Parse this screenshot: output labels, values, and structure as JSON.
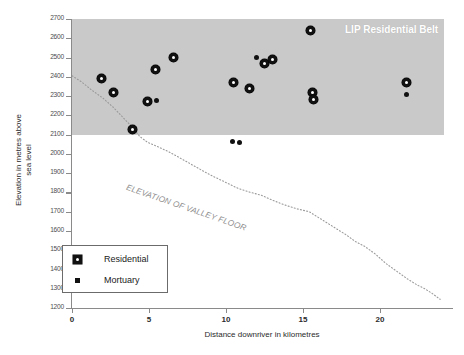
{
  "chart_data": {
    "type": "scatter",
    "title": "",
    "xlabel": "Distance downriver in kilometres",
    "ylabel": "Elevation in metres above sea level",
    "ylabel_line1": "Elevation in metres above",
    "ylabel_line2": "sea level",
    "xlim": [
      0,
      24
    ],
    "ylim": [
      1200,
      2700
    ],
    "xticks": [
      0,
      5,
      10,
      15,
      20
    ],
    "xtick_labels": [
      "0",
      "5",
      "10",
      "15",
      "20"
    ],
    "yticks": [
      1200,
      1300,
      1400,
      1500,
      1600,
      1700,
      1800,
      1900,
      2000,
      2100,
      2200,
      2300,
      2400,
      2500,
      2600,
      2700
    ],
    "ytick_labels": [
      "1200",
      "1300",
      "1400",
      "1500",
      "1600",
      "1700",
      "1800",
      "1900",
      "2000",
      "2100",
      "2200",
      "2300",
      "2400",
      "2500",
      "2600",
      "2700"
    ],
    "grid": false,
    "legend_position": "lower-left",
    "series": [
      {
        "name": "Residential",
        "marker": "ring",
        "color": "#111111",
        "points": [
          {
            "x": 1.9,
            "y": 2390
          },
          {
            "x": 2.7,
            "y": 2320
          },
          {
            "x": 3.9,
            "y": 2125
          },
          {
            "x": 4.9,
            "y": 2270
          },
          {
            "x": 5.4,
            "y": 2440
          },
          {
            "x": 6.6,
            "y": 2500
          },
          {
            "x": 10.5,
            "y": 2370
          },
          {
            "x": 11.5,
            "y": 2340
          },
          {
            "x": 12.5,
            "y": 2470
          },
          {
            "x": 13.0,
            "y": 2490
          },
          {
            "x": 15.5,
            "y": 2640
          },
          {
            "x": 15.6,
            "y": 2320
          },
          {
            "x": 15.7,
            "y": 2285
          },
          {
            "x": 21.7,
            "y": 2370
          }
        ]
      },
      {
        "name": "Mortuary",
        "marker": "dot",
        "color": "#111111",
        "points": [
          {
            "x": 5.5,
            "y": 2275
          },
          {
            "x": 10.4,
            "y": 2065
          },
          {
            "x": 10.9,
            "y": 2060
          },
          {
            "x": 12.0,
            "y": 2500
          },
          {
            "x": 21.7,
            "y": 2310
          }
        ]
      }
    ],
    "shaded_band": {
      "label": "LIP Residential Belt",
      "color": "#c9c9c9",
      "y_min": 2100,
      "y_max": 2700,
      "x_min": 0,
      "x_max": 24
    },
    "annotations": [
      {
        "text": "ELEVATION OF VALLEY FLOOR",
        "role": "valley-floor-curve-label"
      }
    ],
    "valley_floor_curve": {
      "name": "Elevation of valley floor",
      "style": "dotted",
      "color": "#9a9a9a",
      "points": [
        {
          "x": 0.0,
          "y": 2405
        },
        {
          "x": 0.6,
          "y": 2375
        },
        {
          "x": 1.3,
          "y": 2330
        },
        {
          "x": 2.0,
          "y": 2290
        },
        {
          "x": 2.7,
          "y": 2240
        },
        {
          "x": 3.3,
          "y": 2190
        },
        {
          "x": 3.9,
          "y": 2140
        },
        {
          "x": 4.4,
          "y": 2090
        },
        {
          "x": 4.9,
          "y": 2060
        },
        {
          "x": 5.5,
          "y": 2040
        },
        {
          "x": 6.3,
          "y": 2010
        },
        {
          "x": 7.2,
          "y": 1970
        },
        {
          "x": 8.1,
          "y": 1930
        },
        {
          "x": 9.0,
          "y": 1890
        },
        {
          "x": 9.9,
          "y": 1855
        },
        {
          "x": 10.8,
          "y": 1820
        },
        {
          "x": 11.6,
          "y": 1800
        },
        {
          "x": 12.3,
          "y": 1785
        },
        {
          "x": 13.0,
          "y": 1760
        },
        {
          "x": 13.8,
          "y": 1735
        },
        {
          "x": 14.6,
          "y": 1715
        },
        {
          "x": 15.4,
          "y": 1700
        },
        {
          "x": 16.2,
          "y": 1660
        },
        {
          "x": 17.0,
          "y": 1620
        },
        {
          "x": 17.8,
          "y": 1580
        },
        {
          "x": 18.4,
          "y": 1545
        },
        {
          "x": 19.0,
          "y": 1520
        },
        {
          "x": 19.7,
          "y": 1480
        },
        {
          "x": 20.4,
          "y": 1430
        },
        {
          "x": 21.1,
          "y": 1390
        },
        {
          "x": 21.8,
          "y": 1350
        },
        {
          "x": 22.4,
          "y": 1320
        },
        {
          "x": 22.9,
          "y": 1300
        },
        {
          "x": 23.4,
          "y": 1275
        },
        {
          "x": 23.9,
          "y": 1245
        }
      ]
    },
    "legend": {
      "entries": [
        {
          "label": "Residential",
          "marker": "ring"
        },
        {
          "label": "Mortuary",
          "marker": "dot"
        }
      ]
    }
  }
}
